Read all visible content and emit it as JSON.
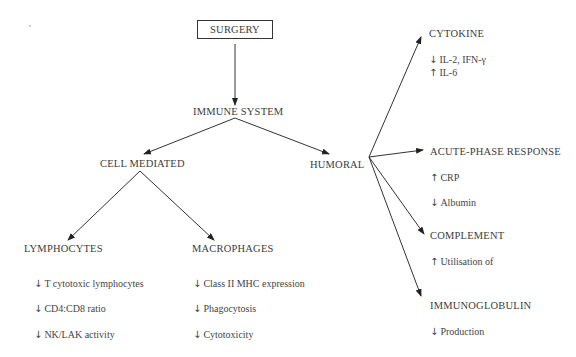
{
  "root": {
    "label": "SURGERY"
  },
  "level1": {
    "label": "IMMUNE SYSTEM"
  },
  "branches": {
    "cell_mediated": {
      "label": "CELL MEDIATED",
      "children": {
        "lymphocytes": {
          "label": "LYMPHOCYTES",
          "effects": [
            {
              "direction": "↓",
              "text": "T cytotoxic lymphocytes"
            },
            {
              "direction": "↓",
              "text": "CD4:CD8 ratio"
            },
            {
              "direction": "↓",
              "text": "NK/LAK activity"
            }
          ]
        },
        "macrophages": {
          "label": "MACROPHAGES",
          "effects": [
            {
              "direction": "↓",
              "text": "Class II MHC expression"
            },
            {
              "direction": "↓",
              "text": "Phagocytosis"
            },
            {
              "direction": "↓",
              "text": "Cytotoxicity"
            }
          ]
        }
      }
    },
    "humoral": {
      "label": "HUMORAL",
      "children": {
        "cytokine": {
          "label": "CYTOKINE",
          "effects": [
            {
              "direction": "↓",
              "text": "IL-2, IFN-γ"
            },
            {
              "direction": "↑",
              "text": "IL-6"
            }
          ]
        },
        "acute_phase": {
          "label": "ACUTE-PHASE RESPONSE",
          "effects": [
            {
              "direction": "↑",
              "text": "CRP"
            },
            {
              "direction": "↓",
              "text": "Albumin"
            }
          ]
        },
        "complement": {
          "label": "COMPLEMENT",
          "effects": [
            {
              "direction": "↑",
              "text": "Utilisation of"
            }
          ]
        },
        "immunoglobulin": {
          "label": "IMMUNOGLOBULIN",
          "effects": [
            {
              "direction": "↓",
              "text": "Production"
            }
          ]
        }
      }
    }
  }
}
